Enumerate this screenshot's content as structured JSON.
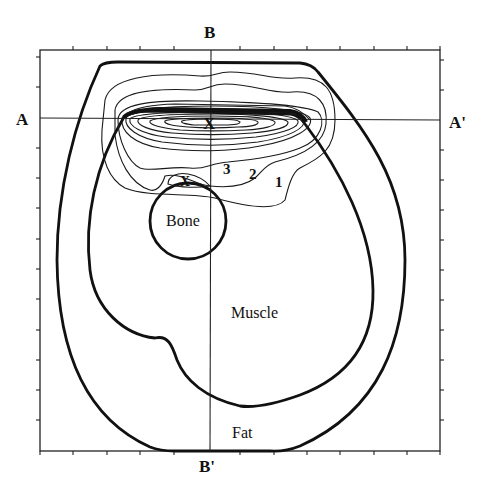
{
  "figure": {
    "axis_labels": {
      "top": "B",
      "bottom": "B'",
      "left": "A",
      "right": "A'"
    },
    "regions": {
      "bone": "Bone",
      "muscle": "Muscle",
      "fat": "Fat"
    },
    "contour_labels": [
      "1",
      "2",
      "3"
    ],
    "markers": {
      "primary_max": "X",
      "secondary_max": "X"
    },
    "colors": {
      "line": "#111111",
      "background": "#ffffff"
    },
    "frame": {
      "ticks_per_side": 12
    }
  }
}
